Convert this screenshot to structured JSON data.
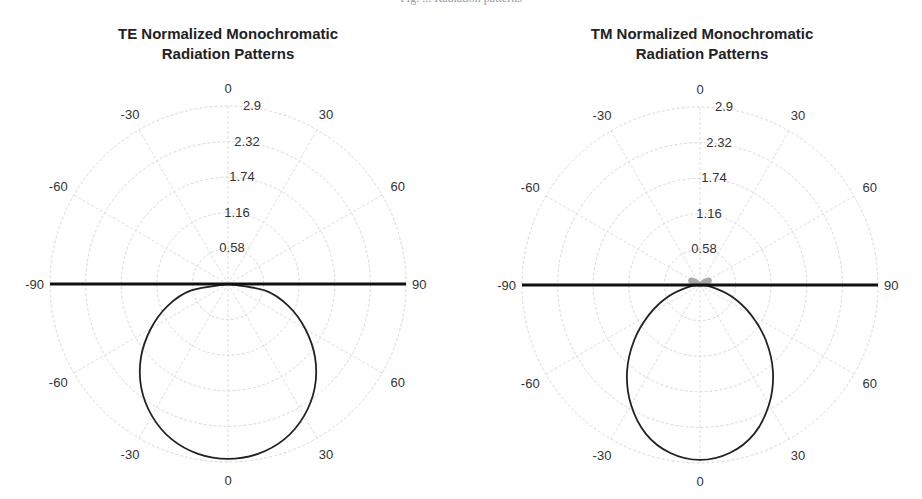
{
  "page": {
    "top_cutoff_text": "Fig. ... Radiation patterns"
  },
  "charts": [
    {
      "title": "TE Normalized Monochromatic\nRadiation Patterns",
      "center": [
        228,
        284
      ],
      "radius_px": 178
    },
    {
      "title": "TM Normalized Monochromatic\nRadiation Patterns",
      "center": [
        700,
        285
      ],
      "radius_px": 178
    }
  ],
  "chart_data": [
    {
      "type": "polar-line",
      "title": "TE Normalized Monochromatic Radiation Patterns",
      "angular_ticks_upper": [
        "0",
        "30",
        "60",
        "90",
        "-30",
        "-60",
        "-90"
      ],
      "angular_ticks_lower": [
        "0",
        "30",
        "60",
        "-30",
        "-60"
      ],
      "angular_tick_values_deg": [
        -90,
        -60,
        -30,
        0,
        30,
        60,
        90
      ],
      "radial_ticks": [
        "0.58",
        "1.16",
        "1.74",
        "2.32",
        "2.9"
      ],
      "rlim": [
        0,
        2.9
      ],
      "grid": true,
      "series": [
        {
          "name": "TE pattern (lower half-space)",
          "color": "#222222",
          "angle_deg_from_downward": [
            -90,
            -80,
            -70,
            -60,
            -50,
            -40,
            -30,
            -20,
            -10,
            0,
            10,
            20,
            30,
            40,
            50,
            60,
            70,
            80,
            90
          ],
          "r": [
            0.0,
            0.62,
            1.05,
            1.45,
            1.85,
            2.2,
            2.48,
            2.69,
            2.81,
            2.85,
            2.81,
            2.69,
            2.48,
            2.2,
            1.85,
            1.45,
            1.05,
            0.62,
            0.0
          ]
        },
        {
          "name": "Interface (horizontal line)",
          "color": "#111111",
          "from_deg": -90,
          "to_deg": 90,
          "r_full": 2.9
        }
      ]
    },
    {
      "type": "polar-line",
      "title": "TM Normalized Monochromatic Radiation Patterns",
      "angular_ticks_upper": [
        "0",
        "30",
        "60",
        "90",
        "-30",
        "-60",
        "-90"
      ],
      "angular_ticks_lower": [
        "0",
        "30",
        "60",
        "-30",
        "-60"
      ],
      "angular_tick_values_deg": [
        -90,
        -60,
        -30,
        0,
        30,
        60,
        90
      ],
      "radial_ticks": [
        "0.58",
        "1.16",
        "1.74",
        "2.32",
        "2.9"
      ],
      "rlim": [
        0,
        2.9
      ],
      "grid": true,
      "series": [
        {
          "name": "TM pattern (lower half-space)",
          "color": "#222222",
          "angle_deg_from_downward": [
            -90,
            -80,
            -70,
            -60,
            -50,
            -40,
            -30,
            -20,
            -10,
            0,
            10,
            20,
            30,
            40,
            50,
            60,
            70,
            80,
            90
          ],
          "r": [
            0.0,
            0.2,
            0.55,
            0.95,
            1.4,
            1.85,
            2.25,
            2.58,
            2.78,
            2.85,
            2.78,
            2.58,
            2.25,
            1.85,
            1.4,
            0.95,
            0.55,
            0.2,
            0.0
          ]
        },
        {
          "name": "TM side lobes (upper half-space)",
          "color": "#9a9a9a",
          "angle_deg_from_upward": [
            -90,
            -80,
            -70,
            -60,
            -50,
            -40,
            -35,
            -30,
            -40,
            -50,
            -60,
            -70,
            -80,
            -90
          ],
          "r": [
            0,
            0.08,
            0.14,
            0.17,
            0.15,
            0.1,
            0.05,
            0.0,
            0,
            0,
            0,
            0,
            0,
            0
          ]
        },
        {
          "name": "Interface (horizontal line)",
          "color": "#111111",
          "from_deg": -90,
          "to_deg": 90,
          "r_full": 2.9
        }
      ]
    }
  ]
}
